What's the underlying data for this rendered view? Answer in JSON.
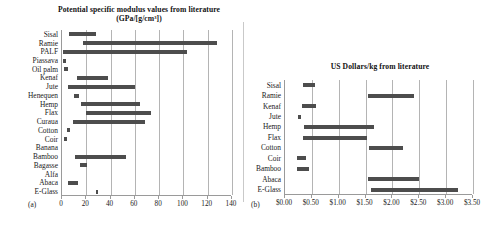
{
  "figure": {
    "panel_a_letter": "(a)",
    "panel_b_letter": "(b)"
  },
  "chart_data": [
    {
      "type": "bar",
      "orientation": "horizontal",
      "subtype": "range-bar",
      "panel": "a",
      "title": "Potential specific modulus values from literature (GPa/[g/cm³])",
      "xlabel": "",
      "ylabel": "",
      "xlim": [
        0,
        140
      ],
      "xticks": [
        "0",
        "20",
        "40",
        "60",
        "80",
        "100",
        "120",
        "140"
      ],
      "xtick_values": [
        0,
        20,
        40,
        60,
        80,
        100,
        120,
        140
      ],
      "grid": true,
      "legend": "none",
      "categories": [
        "Sisal",
        "Ramie",
        "PALF",
        "Piassava",
        "Oil palm",
        "Kenaf",
        "Jute",
        "Henequen",
        "Hemp",
        "Flax",
        "Curaua",
        "Cotton",
        "Coir",
        "Banana",
        "Bamboo",
        "Bagasse",
        "Alfa",
        "Abaca",
        "E-Glass"
      ],
      "ranges": [
        {
          "category": "Sisal",
          "low": 6,
          "high": 28
        },
        {
          "category": "Ramie",
          "low": 17,
          "high": 128
        },
        {
          "category": "PALF",
          "low": 1,
          "high": 103
        },
        {
          "category": "Piassava",
          "low": 1,
          "high": 3
        },
        {
          "category": "Oil palm",
          "low": 2,
          "high": 5
        },
        {
          "category": "Kenaf",
          "low": 12,
          "high": 38
        },
        {
          "category": "Jute",
          "low": 5,
          "high": 60
        },
        {
          "category": "Henequen",
          "low": 10,
          "high": 14
        },
        {
          "category": "Hemp",
          "low": 16,
          "high": 64
        },
        {
          "category": "Flax",
          "low": 20,
          "high": 73
        },
        {
          "category": "Curaua",
          "low": 9,
          "high": 68
        },
        {
          "category": "Cotton",
          "low": 4,
          "high": 7
        },
        {
          "category": "Coir",
          "low": 2,
          "high": 4
        },
        {
          "category": "Banana",
          "low": 0,
          "high": 0
        },
        {
          "category": "Bamboo",
          "low": 11,
          "high": 53
        },
        {
          "category": "Bagasse",
          "low": 15,
          "high": 21
        },
        {
          "category": "Alfa",
          "low": 0,
          "high": 0
        },
        {
          "category": "Abaca",
          "low": 5,
          "high": 13
        },
        {
          "category": "E-Glass",
          "low": 28,
          "high": 29
        }
      ]
    },
    {
      "type": "bar",
      "orientation": "horizontal",
      "subtype": "range-bar",
      "panel": "b",
      "title": "US Dollars/kg from literature",
      "xlabel": "",
      "ylabel": "",
      "xlim": [
        0,
        3.5
      ],
      "xticks": [
        "$0.00",
        "$0.50",
        "$1.00",
        "$1.50",
        "$2.00",
        "$2.50",
        "$3.00",
        "$3.50"
      ],
      "xtick_values": [
        0,
        0.5,
        1.0,
        1.5,
        2.0,
        2.5,
        3.0,
        3.5
      ],
      "grid": true,
      "legend": "none",
      "categories": [
        "Sisal",
        "Ramie",
        "Kenaf",
        "Jute",
        "Hemp",
        "Flax",
        "Cotton",
        "Coir",
        "Bamboo",
        "Abaca",
        "E-Glass"
      ],
      "ranges": [
        {
          "category": "Sisal",
          "low": 0.33,
          "high": 0.56
        },
        {
          "category": "Ramie",
          "low": 1.55,
          "high": 2.4
        },
        {
          "category": "Kenaf",
          "low": 0.32,
          "high": 0.57
        },
        {
          "category": "Jute",
          "low": 0.25,
          "high": 0.3
        },
        {
          "category": "Hemp",
          "low": 0.35,
          "high": 1.65
        },
        {
          "category": "Flax",
          "low": 0.33,
          "high": 1.52
        },
        {
          "category": "Cotton",
          "low": 1.56,
          "high": 2.2
        },
        {
          "category": "Coir",
          "low": 0.22,
          "high": 0.4
        },
        {
          "category": "Bamboo",
          "low": 0.22,
          "high": 0.45
        },
        {
          "category": "Abaca",
          "low": 1.55,
          "high": 2.5
        },
        {
          "category": "E-Glass",
          "low": 1.6,
          "high": 3.22
        }
      ]
    }
  ]
}
